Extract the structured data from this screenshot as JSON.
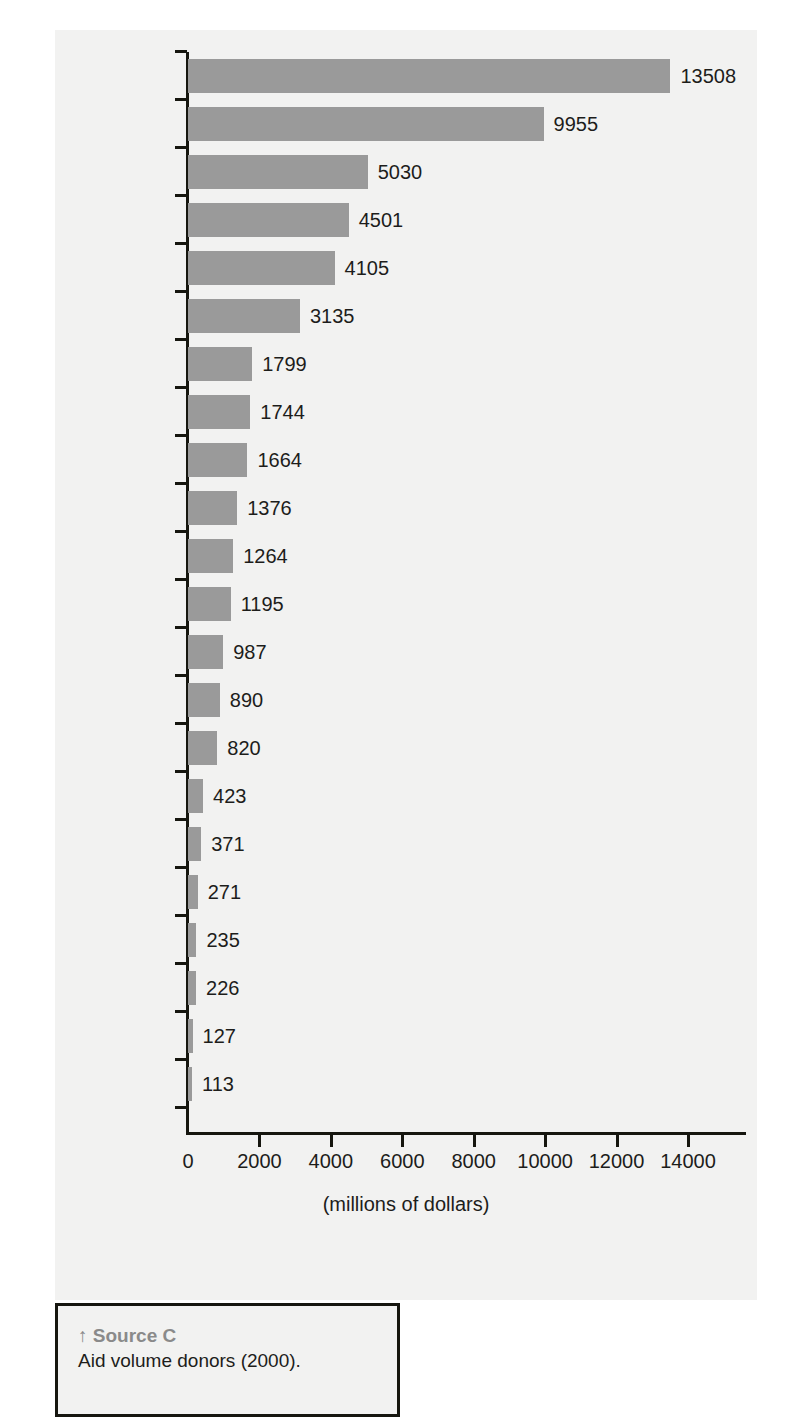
{
  "chart_data": {
    "type": "bar",
    "orientation": "horizontal",
    "title": "",
    "xlabel": "(millions of dollars)",
    "ylabel": "",
    "xlim": [
      0,
      14000
    ],
    "xticks": [
      0,
      2000,
      4000,
      6000,
      8000,
      10000,
      12000,
      14000
    ],
    "xtick_labels": [
      "0",
      "2000",
      "4000",
      "6000",
      "8000",
      "10000",
      "12000",
      "14000"
    ],
    "grid": false,
    "legend": null,
    "bar_color": "#9a9a9a",
    "value_labels_shown": true,
    "categories": [
      "Japan",
      "USA",
      "Germany",
      "UK",
      "France",
      "Netherlands",
      "Sweden",
      "Canada",
      "Denmark",
      "Italy",
      "Norway",
      "Spain",
      "Australia",
      "Switzerland",
      "Belgium",
      "Austria",
      "Finland",
      "Portugal",
      "Ireland",
      "Greece",
      "Luxembourg",
      "New Zealand"
    ],
    "values": [
      13508,
      9955,
      5030,
      4501,
      4105,
      3135,
      1799,
      1744,
      1664,
      1376,
      1264,
      1195,
      987,
      890,
      820,
      423,
      371,
      271,
      235,
      226,
      127,
      113
    ],
    "value_label_texts": [
      "13508",
      "9955",
      "5030",
      "4501",
      "4105",
      "3135",
      "1799",
      "1744",
      "1664",
      "1376",
      "1264",
      "1195",
      "987",
      "890",
      "820",
      "423",
      "371",
      "271",
      "235",
      "226",
      "127",
      "113"
    ]
  },
  "caption": {
    "arrow": "↑",
    "title": "Source C",
    "text": "Aid volume donors (2000)."
  },
  "colors": {
    "bar": "#9a9a9a",
    "panel_background": "#f2f2f1",
    "axis": "#16160f",
    "text": "#1d1d1b",
    "caption_title": "#8a8a8a"
  }
}
